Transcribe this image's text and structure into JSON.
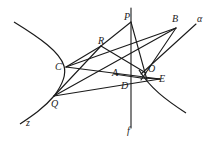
{
  "figure": {
    "type": "geometry-diagram",
    "points": [
      {
        "id": "P",
        "label": "P"
      },
      {
        "id": "B",
        "label": "B"
      },
      {
        "id": "R",
        "label": "R"
      },
      {
        "id": "C",
        "label": "C"
      },
      {
        "id": "A",
        "label": "A"
      },
      {
        "id": "O",
        "label": "O"
      },
      {
        "id": "E",
        "label": "E"
      },
      {
        "id": "D",
        "label": "D"
      },
      {
        "id": "Q",
        "label": "Q"
      }
    ],
    "lines": [
      {
        "id": "alpha",
        "label": "α"
      },
      {
        "id": "f",
        "label": "f"
      },
      {
        "id": "z",
        "label": "z"
      }
    ],
    "segments": [
      [
        "R",
        "O"
      ],
      [
        "R",
        "Q"
      ],
      [
        "C",
        "R"
      ],
      [
        "C",
        "E"
      ],
      [
        "C",
        "B"
      ],
      [
        "Q",
        "B"
      ],
      [
        "Q",
        "E"
      ],
      [
        "P",
        "E"
      ],
      [
        "B",
        "D"
      ],
      [
        "A",
        "O"
      ]
    ]
  }
}
